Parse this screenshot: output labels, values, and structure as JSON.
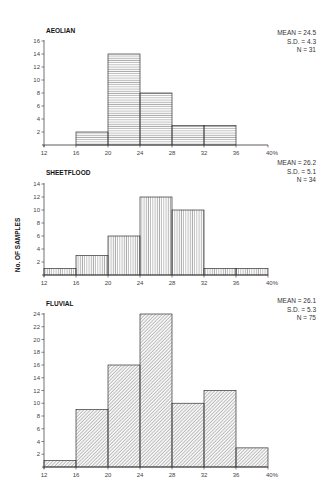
{
  "chart_data": [
    {
      "type": "bar",
      "title": "AEOLIAN",
      "xlabel": "",
      "ylabel": "No. OF SAMPLES",
      "bin_edges": [
        12,
        16,
        20,
        24,
        28,
        32,
        36,
        40
      ],
      "x_tick_labels": [
        "12",
        "16",
        "20",
        "24",
        "28",
        "32",
        "36",
        "40%"
      ],
      "categories": [
        "12-16",
        "16-20",
        "20-24",
        "24-28",
        "28-32",
        "32-36",
        "36-40"
      ],
      "values": [
        0,
        2,
        14,
        8,
        3,
        3,
        0
      ],
      "y_ticks": [
        2,
        4,
        6,
        8,
        10,
        12,
        14,
        16
      ],
      "ylim": [
        0,
        16
      ],
      "hatch": "horizontal",
      "stats": {
        "mean": "MEAN = 24.5",
        "sd": "S.D. = 4.3",
        "n": "N = 31"
      }
    },
    {
      "type": "bar",
      "title": "SHEETFLOOD",
      "xlabel": "",
      "ylabel": "No. OF SAMPLES",
      "bin_edges": [
        12,
        16,
        20,
        24,
        28,
        32,
        36,
        40
      ],
      "x_tick_labels": [
        "12",
        "16",
        "20",
        "24",
        "28",
        "32",
        "36",
        "40%"
      ],
      "categories": [
        "12-16",
        "16-20",
        "20-24",
        "24-28",
        "28-32",
        "32-36",
        "36-40"
      ],
      "values": [
        1,
        3,
        6,
        12,
        10,
        1,
        1
      ],
      "y_ticks": [
        2,
        4,
        6,
        8,
        10,
        12,
        14
      ],
      "ylim": [
        0,
        14
      ],
      "hatch": "vertical",
      "stats": {
        "mean": "MEAN = 26.2",
        "sd": "S.D. = 5.1",
        "n": "N = 34"
      }
    },
    {
      "type": "bar",
      "title": "FLUVIAL",
      "xlabel": "",
      "ylabel": "No. OF SAMPLES",
      "bin_edges": [
        12,
        16,
        20,
        24,
        28,
        32,
        36,
        40
      ],
      "x_tick_labels": [
        "12",
        "16",
        "20",
        "24",
        "28",
        "32",
        "36",
        "40%"
      ],
      "categories": [
        "12-16",
        "16-20",
        "20-24",
        "24-28",
        "28-32",
        "32-36",
        "36-40"
      ],
      "values": [
        1,
        9,
        16,
        24,
        10,
        12,
        3
      ],
      "y_ticks": [
        2,
        4,
        6,
        8,
        10,
        12,
        14,
        16,
        18,
        20,
        22,
        24
      ],
      "ylim": [
        0,
        24
      ],
      "hatch": "diagonal",
      "stats": {
        "mean": "MEAN = 26.1",
        "sd": "S.D. = 5.3",
        "n": "N = 75"
      }
    }
  ],
  "shared": {
    "y_axis_label": "No. OF SAMPLES"
  },
  "colors": {
    "axis": "#333333",
    "bar_outline": "#333333",
    "hatch": "#6a6a6a",
    "background": "#ffffff"
  }
}
